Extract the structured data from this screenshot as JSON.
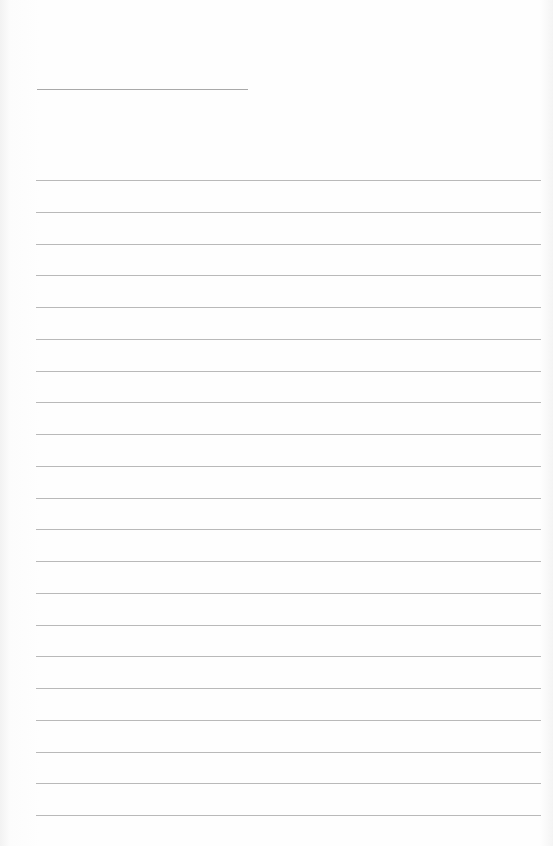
{
  "page": {
    "type": "lined-paper",
    "title_line": {
      "x": 37,
      "y": 89,
      "width": 211,
      "color": "#a9a9a9"
    },
    "rules": {
      "count": 21,
      "start_y": 180,
      "spacing": 31.75,
      "x": 36,
      "width": 505,
      "color": "#b9b9b9"
    }
  }
}
